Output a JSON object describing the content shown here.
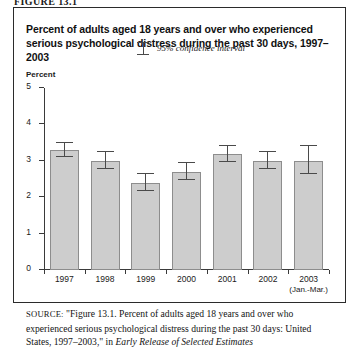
{
  "figure": {
    "number_label": "FIGURE 13.1",
    "title": "Percent of adults aged 18 years and over who experienced serious psychological distress during the past 30 days, 1997–2003",
    "unit_label": "Percent"
  },
  "legend": {
    "symbol_name": "error-bar-symbol",
    "label": "95% confidence interval"
  },
  "source": {
    "label": "SOURCE:",
    "line1": "\"Figure 13.1. Percent of adults aged 18 years and over who",
    "line2": "experienced serious psychological distress during the past 30 days:",
    "line3_plain": "United States, 1997–2003,\" in ",
    "line3_italic": "Early Release of Selected Estimates"
  },
  "colors": {
    "bar_fill": "#cdcdcd",
    "bar_stroke": "#8d8d8d",
    "axis": "#3a3a3a",
    "error_bar": "#4a4a4a",
    "frame": "#2b2b2b"
  },
  "chart_data": {
    "type": "bar",
    "title": "Percent of adults aged 18 years and over who experienced serious psychological distress during the past 30 days, 1997–2003",
    "xlabel": "",
    "ylabel": "Percent",
    "ylim": [
      0,
      5
    ],
    "yticks": [
      0,
      1,
      2,
      3,
      4,
      5
    ],
    "ytick_labels": [
      "0",
      "1",
      "2",
      "3",
      "4",
      "5"
    ],
    "grid": false,
    "legend_position": "top-center",
    "categories": [
      "1997",
      "1998",
      "1999",
      "2000",
      "2001",
      "2002",
      "2003"
    ],
    "category_sublabels": [
      "",
      "",
      "",
      "",
      "",
      "",
      "(Jan.-Mar.)"
    ],
    "values": [
      3.3,
      3.0,
      2.4,
      2.7,
      3.2,
      3.0,
      3.0
    ],
    "error_low": [
      3.1,
      2.78,
      2.18,
      2.48,
      2.98,
      2.78,
      2.65
    ],
    "error_high": [
      3.48,
      3.23,
      2.65,
      2.93,
      3.42,
      3.23,
      3.42
    ],
    "error_label": "95% confidence interval"
  }
}
